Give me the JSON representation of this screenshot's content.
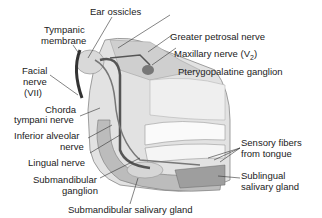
{
  "diagram": {
    "type": "anatomical-illustration",
    "labels": {
      "ear_ossicles": "Ear ossicles",
      "tympanic_membrane_1": "Tympanic",
      "tympanic_membrane_2": "membrane",
      "greater_petrosal": "Greater petrosal nerve",
      "maxillary": "Maxillary nerve (V",
      "maxillary_sub": "2",
      "maxillary_end": ")",
      "pterygopalatine": "Pterygopalatine ganglion",
      "facial_1": "Facial",
      "facial_2": "nerve",
      "facial_3": "(VII)",
      "chorda_1": "Chorda",
      "chorda_2": "tympani nerve",
      "inferior_alveolar_1": "Inferior alveolar",
      "inferior_alveolar_2": "nerve",
      "lingual": "Lingual nerve",
      "submandibular_ganglion_1": "Submandibular",
      "submandibular_ganglion_2": "ganglion",
      "submandibular_gland": "Submandibular salivary gland",
      "sensory_1": "Sensory fibers",
      "sensory_2": "from tongue",
      "sublingual_1": "Sublingual",
      "sublingual_2": "salivary gland"
    }
  }
}
